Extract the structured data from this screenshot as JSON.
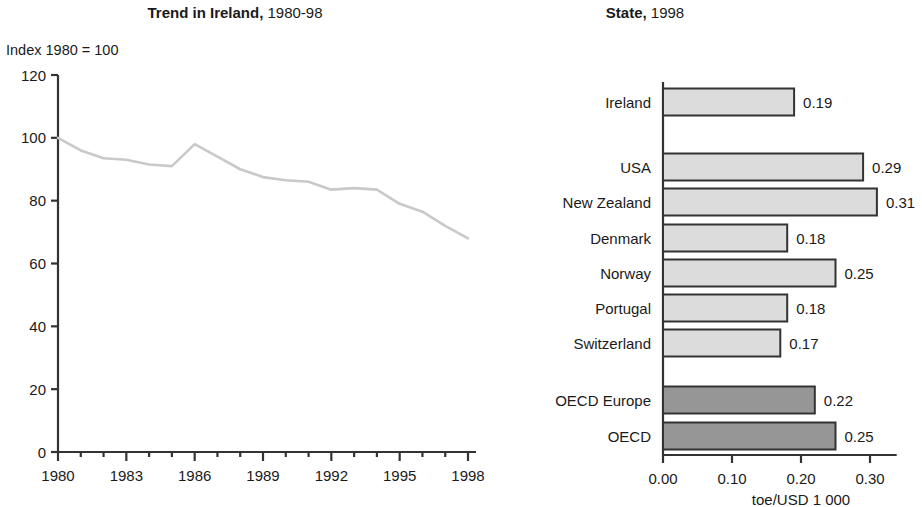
{
  "left": {
    "title_bold": "Trend in Ireland,",
    "title_rest": " 1980-98",
    "axis_note": "Index 1980 = 100"
  },
  "right": {
    "title_bold": "State,",
    "title_rest": " 1998",
    "unit": "toe/USD 1 000"
  },
  "colors": {
    "line": "#c9c9c9",
    "axis": "#333333",
    "bar_light": "#dcdcdc",
    "bar_dark": "#969696",
    "bar_border": "#333333",
    "text": "#1a1a1a"
  },
  "chart_data": [
    {
      "type": "line",
      "title": "Trend in Ireland, 1980-98",
      "xlabel": "",
      "ylabel": "Index 1980 = 100",
      "ylim": [
        0,
        120
      ],
      "yticks": [
        0,
        20,
        40,
        60,
        80,
        100,
        120
      ],
      "xlim": [
        1980,
        1998
      ],
      "xticks": [
        1980,
        1983,
        1986,
        1989,
        1992,
        1995,
        1998
      ],
      "grid": false,
      "legend": "none",
      "x": [
        1980,
        1981,
        1982,
        1983,
        1984,
        1985,
        1986,
        1987,
        1988,
        1989,
        1990,
        1991,
        1992,
        1993,
        1994,
        1995,
        1996,
        1997,
        1998
      ],
      "values": [
        100,
        96,
        93.5,
        93,
        91.5,
        91,
        98,
        94,
        90,
        87.5,
        86.5,
        86,
        83.5,
        84,
        83.5,
        79,
        76.5,
        72,
        68
      ]
    },
    {
      "type": "bar",
      "orientation": "horizontal",
      "title": "State, 1998",
      "xlabel": "toe/USD 1 000",
      "ylabel": "",
      "xlim": [
        0,
        0.33
      ],
      "xticks": [
        0.0,
        0.1,
        0.2,
        0.3
      ],
      "xtick_labels": [
        "0.00",
        "0.10",
        "0.20",
        "0.30"
      ],
      "grid": false,
      "legend": "none",
      "categories": [
        "Ireland",
        "USA",
        "New Zealand",
        "Denmark",
        "Norway",
        "Portugal",
        "Switzerland",
        "OECD Europe",
        "OECD"
      ],
      "values": [
        0.19,
        0.29,
        0.31,
        0.18,
        0.25,
        0.18,
        0.17,
        0.22,
        0.25
      ],
      "value_labels": [
        "0.19",
        "0.29",
        "0.31",
        "0.18",
        "0.25",
        "0.18",
        "0.17",
        "0.22",
        "0.25"
      ],
      "bar_groups": [
        "country",
        "country",
        "country",
        "country",
        "country",
        "country",
        "country",
        "aggregate",
        "aggregate"
      ]
    }
  ]
}
